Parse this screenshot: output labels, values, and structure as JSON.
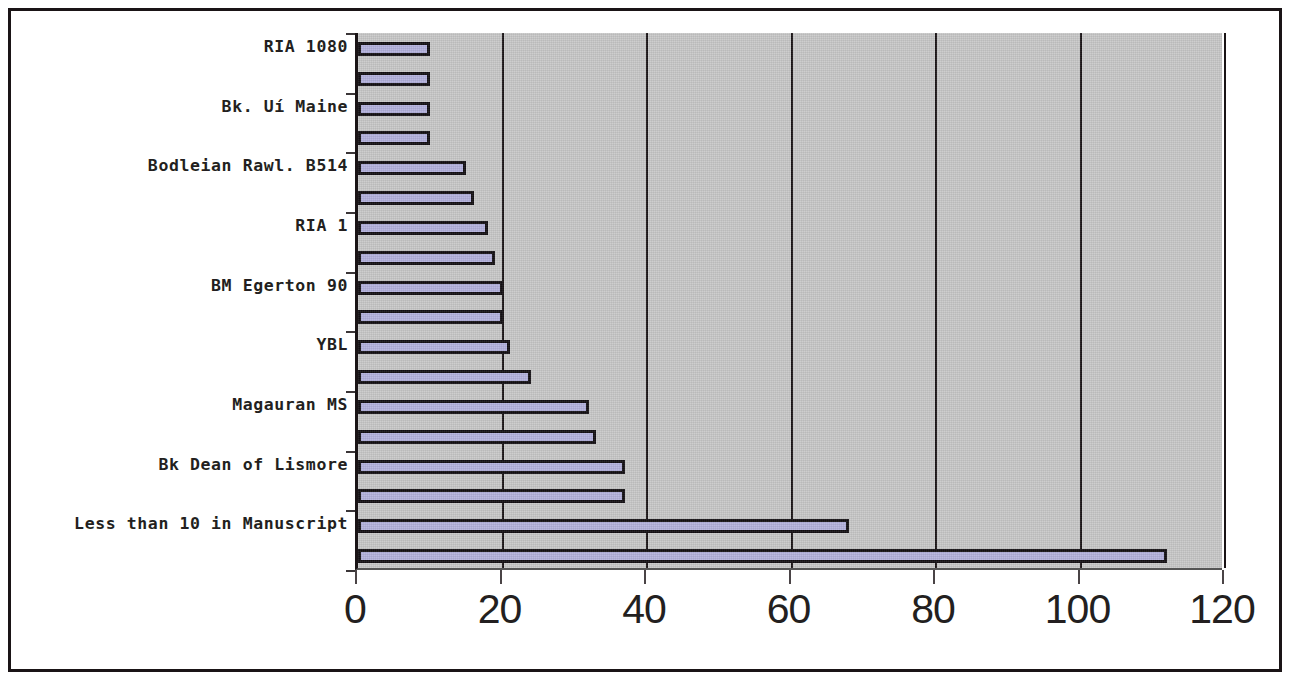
{
  "chart_data": {
    "type": "bar",
    "orientation": "horizontal",
    "title": "",
    "xlabel": "",
    "ylabel": "",
    "xlim": [
      0,
      120
    ],
    "xticks": [
      0,
      20,
      40,
      60,
      80,
      100,
      120
    ],
    "xtick_labels": [
      "0",
      "20",
      "40",
      "60",
      "80",
      "100",
      "120"
    ],
    "grid": true,
    "grid_axis": "x",
    "legend": false,
    "bar_color": "#b3b1dd",
    "bar_edge_color": "#120e12",
    "plot_background": "#c8c8c8",
    "categories": [
      "RIA 1080",
      "Bk. Uí Maine",
      "Bodleian Rawl. B514",
      "RIA 1",
      "BM Egerton 90",
      "YBL",
      "Magauran MS",
      "Bk Dean of Lismore",
      "Less than 10 in Manuscript"
    ],
    "series": [
      {
        "name": "Series 1",
        "values": [
          10,
          10,
          15,
          18,
          20,
          21,
          32,
          37,
          68
        ]
      },
      {
        "name": "Series 2",
        "values": [
          10,
          10,
          16,
          19,
          20,
          24,
          33,
          37,
          112
        ]
      }
    ],
    "bars": [
      {
        "category": "RIA 1080",
        "value": 10
      },
      {
        "category": "RIA 1080",
        "value": 10
      },
      {
        "category": "Bk. Uí Maine",
        "value": 10
      },
      {
        "category": "Bk. Uí Maine",
        "value": 10
      },
      {
        "category": "Bodleian Rawl. B514",
        "value": 15
      },
      {
        "category": "Bodleian Rawl. B514",
        "value": 16
      },
      {
        "category": "RIA 1",
        "value": 18
      },
      {
        "category": "RIA 1",
        "value": 19
      },
      {
        "category": "BM Egerton 90",
        "value": 20
      },
      {
        "category": "BM Egerton 90",
        "value": 20
      },
      {
        "category": "YBL",
        "value": 21
      },
      {
        "category": "YBL",
        "value": 24
      },
      {
        "category": "Magauran MS",
        "value": 32
      },
      {
        "category": "Magauran MS",
        "value": 33
      },
      {
        "category": "Bk Dean of Lismore",
        "value": 37
      },
      {
        "category": "Bk Dean of Lismore",
        "value": 37
      },
      {
        "category": "Less than 10 in Manuscript",
        "value": 68
      },
      {
        "category": "Less than 10 in Manuscript",
        "value": 112
      }
    ]
  }
}
